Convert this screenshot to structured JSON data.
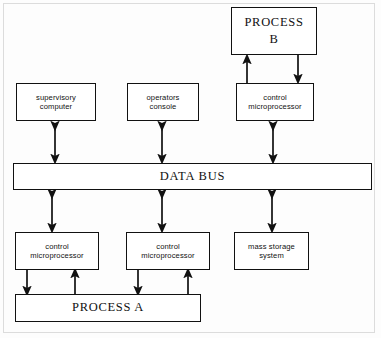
{
  "diagram": {
    "style": {
      "line_color": "#111111",
      "background": "#fdfdfd",
      "frame_color": "#dcdcdc"
    },
    "nodes": [
      {
        "id": "process_b",
        "label_lines": [
          "PROCESS",
          "B"
        ],
        "size": "big",
        "x": 231,
        "y": 7,
        "w": 86,
        "h": 48
      },
      {
        "id": "supervisory",
        "label_lines": [
          "supervisory",
          "computer"
        ],
        "size": "small",
        "x": 16,
        "y": 83,
        "w": 80,
        "h": 38
      },
      {
        "id": "operators",
        "label_lines": [
          "operators",
          "console"
        ],
        "size": "small",
        "x": 127,
        "y": 83,
        "w": 72,
        "h": 38
      },
      {
        "id": "ctrl_micro_top",
        "label_lines": [
          "control",
          "microprocessor"
        ],
        "size": "small",
        "x": 236,
        "y": 83,
        "w": 78,
        "h": 38
      },
      {
        "id": "ctrl_micro_left",
        "label_lines": [
          "control",
          "microprocessor"
        ],
        "size": "small",
        "x": 15,
        "y": 232,
        "w": 84,
        "h": 38
      },
      {
        "id": "ctrl_micro_mid",
        "label_lines": [
          "control",
          "microprocessor"
        ],
        "size": "small",
        "x": 126,
        "y": 232,
        "w": 84,
        "h": 38
      },
      {
        "id": "mass_storage",
        "label_lines": [
          "mass storage",
          "system"
        ],
        "size": "small",
        "x": 234,
        "y": 232,
        "w": 75,
        "h": 38
      },
      {
        "id": "process_a",
        "label_lines": [
          "PROCESS  A"
        ],
        "size": "big",
        "x": 15,
        "y": 294,
        "w": 186,
        "h": 28
      }
    ],
    "bus": {
      "id": "data_bus",
      "label": "DATA  BUS",
      "x": 13,
      "y": 163,
      "w": 359,
      "h": 27
    },
    "connections": [
      {
        "from": "supervisory",
        "to": "data_bus",
        "type": "bidirectional",
        "x": 55
      },
      {
        "from": "operators",
        "to": "data_bus",
        "type": "bidirectional",
        "x": 162
      },
      {
        "from": "ctrl_micro_top",
        "to": "data_bus",
        "type": "bidirectional",
        "x": 273
      },
      {
        "from": "ctrl_micro_top",
        "to": "process_b",
        "type": "up",
        "x": 247
      },
      {
        "from": "process_b",
        "to": "ctrl_micro_top",
        "type": "down",
        "x": 298
      },
      {
        "from": "data_bus",
        "to": "ctrl_micro_left",
        "type": "bidirectional",
        "x": 52
      },
      {
        "from": "data_bus",
        "to": "ctrl_micro_mid",
        "type": "bidirectional",
        "x": 162
      },
      {
        "from": "data_bus",
        "to": "mass_storage",
        "type": "bidirectional",
        "x": 272
      },
      {
        "from": "ctrl_micro_left",
        "to": "process_a",
        "type": "down",
        "x": 27
      },
      {
        "from": "process_a",
        "to": "ctrl_micro_left",
        "type": "up",
        "x": 75
      },
      {
        "from": "ctrl_micro_mid",
        "to": "process_a",
        "type": "down",
        "x": 138
      },
      {
        "from": "process_a",
        "to": "ctrl_micro_mid",
        "type": "up",
        "x": 188
      }
    ]
  }
}
